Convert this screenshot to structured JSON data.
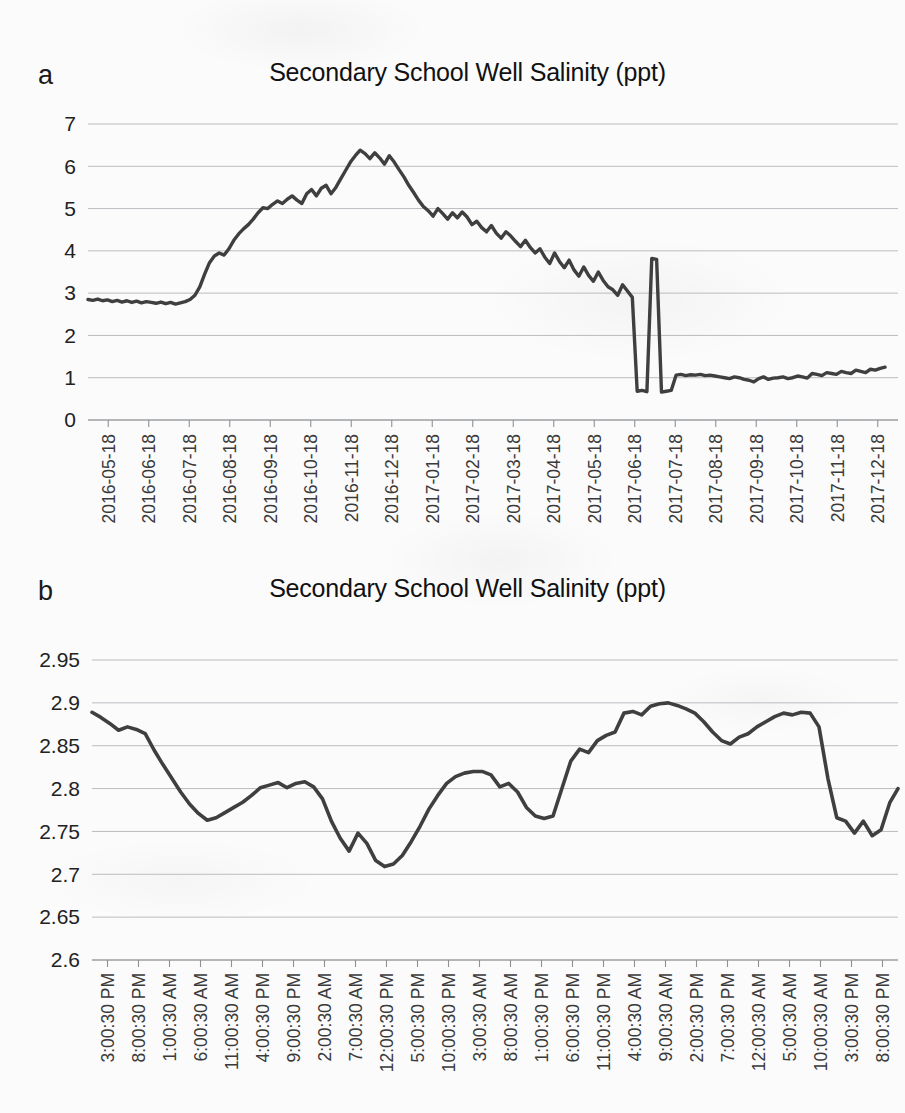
{
  "document": {
    "background_color": "#fbfbfb",
    "ink_color": "#3f3f3f",
    "gridline_color": "#b9bcc0"
  },
  "panels": [
    {
      "letter": "a",
      "title": "Secondary School Well Salinity (ppt)"
    },
    {
      "letter": "b",
      "title": "Secondary School Well Salinity (ppt)"
    }
  ],
  "chart_data": [
    {
      "type": "line",
      "panel": "a",
      "title": "Secondary School Well Salinity (ppt)",
      "xlabel": "",
      "ylabel": "",
      "ylim": [
        0,
        7
      ],
      "yticks": [
        "0",
        "1",
        "2",
        "3",
        "4",
        "5",
        "6",
        "7"
      ],
      "grid": true,
      "legend": "none",
      "x_tick_labels": [
        "2016-05-18",
        "2016-06-18",
        "2016-07-18",
        "2016-08-18",
        "2016-09-18",
        "2016-10-18",
        "2016-11-18",
        "2016-12-18",
        "2017-01-18",
        "2017-02-18",
        "2017-03-18",
        "2017-04-18",
        "2017-05-18",
        "2017-06-18",
        "2017-07-18",
        "2017-08-18",
        "2017-09-18",
        "2017-10-18",
        "2017-11-18",
        "2017-12-18"
      ],
      "x_tick_rotation": -90,
      "series": [
        {
          "name": "Salinity (ppt)",
          "x": [
            0,
            0.6,
            1.2,
            1.8,
            2.4,
            3.0,
            3.6,
            4.2,
            4.8,
            5.4,
            6.0,
            6.6,
            7.2,
            7.8,
            8.4,
            9.0,
            9.6,
            10.2,
            10.8,
            11.4,
            12.0,
            12.6,
            13.2,
            13.8,
            14.4,
            15.0,
            15.6,
            16.2,
            16.8,
            17.4,
            18.0,
            18.6,
            19.2,
            19.8,
            20.4,
            21.0,
            21.6,
            22.2,
            22.8,
            23.4,
            24.0,
            24.6,
            25.2,
            25.8,
            26.4,
            27.0,
            27.6,
            28.2,
            28.8,
            29.4,
            30.0,
            30.6,
            31.2,
            31.8,
            32.4,
            33.0,
            33.6,
            34.2,
            34.8,
            35.4,
            36.0,
            36.6,
            37.2,
            37.8,
            38.4,
            39.0,
            39.6,
            40.2,
            40.8,
            41.4,
            42.0,
            42.6,
            43.2,
            43.8,
            44.4,
            45.0,
            45.6,
            46.2,
            46.8,
            47.4,
            48.0,
            48.6,
            49.2,
            49.8,
            50.4,
            51.0,
            51.6,
            52.2,
            52.8,
            53.4,
            54.0,
            54.6,
            55.2,
            55.8,
            56.4,
            57.0,
            57.6,
            58.2,
            58.8,
            59.4,
            60.0,
            60.6,
            61.2,
            61.8,
            62.4,
            63.0,
            63.6,
            64.2,
            64.8,
            65.4,
            66.0,
            66.6,
            67.2,
            67.8,
            68.4,
            69.0,
            69.6,
            70.2,
            70.8,
            71.4,
            72.0,
            72.6,
            73.2,
            73.8,
            74.4,
            75.0,
            75.6,
            76.2,
            76.8,
            77.4,
            78.0,
            78.6,
            79.2,
            79.8,
            80.4,
            81.0,
            81.6,
            82.2,
            82.8,
            83.4,
            84.0,
            84.6,
            85.2,
            85.8,
            86.4,
            87.0,
            87.6,
            88.2,
            88.8,
            89.4,
            90.0,
            90.6,
            91.2,
            91.8,
            92.4,
            93.0,
            93.6,
            94.2,
            94.8,
            95.4,
            96.0,
            96.6,
            97.2,
            97.8,
            98.4,
            99.0,
            99.6,
            100
          ],
          "y": [
            2.85,
            2.83,
            2.86,
            2.82,
            2.84,
            2.8,
            2.83,
            2.79,
            2.82,
            2.78,
            2.81,
            2.77,
            2.8,
            2.78,
            2.76,
            2.79,
            2.75,
            2.78,
            2.74,
            2.77,
            2.8,
            2.85,
            2.95,
            3.15,
            3.45,
            3.72,
            3.88,
            3.95,
            3.9,
            4.05,
            4.25,
            4.4,
            4.52,
            4.62,
            4.75,
            4.9,
            5.02,
            5.0,
            5.1,
            5.18,
            5.12,
            5.22,
            5.3,
            5.2,
            5.12,
            5.35,
            5.45,
            5.3,
            5.48,
            5.55,
            5.35,
            5.5,
            5.7,
            5.9,
            6.1,
            6.25,
            6.38,
            6.3,
            6.18,
            6.32,
            6.2,
            6.05,
            6.25,
            6.1,
            5.92,
            5.75,
            5.55,
            5.38,
            5.2,
            5.05,
            4.95,
            4.82,
            5.0,
            4.88,
            4.75,
            4.9,
            4.78,
            4.92,
            4.8,
            4.62,
            4.7,
            4.55,
            4.45,
            4.6,
            4.42,
            4.3,
            4.45,
            4.35,
            4.22,
            4.1,
            4.25,
            4.08,
            3.95,
            4.05,
            3.85,
            3.7,
            3.95,
            3.75,
            3.6,
            3.78,
            3.55,
            3.4,
            3.62,
            3.42,
            3.28,
            3.5,
            3.3,
            3.15,
            3.08,
            2.95,
            3.2,
            3.05,
            2.9,
            0.68,
            0.7,
            0.67,
            3.82,
            3.8,
            0.66,
            0.68,
            0.7,
            1.06,
            1.08,
            1.05,
            1.07,
            1.06,
            1.08,
            1.05,
            1.06,
            1.04,
            1.02,
            1.0,
            0.98,
            1.02,
            1.0,
            0.96,
            0.94,
            0.9,
            0.98,
            1.02,
            0.96,
            0.99,
            1.0,
            1.02,
            0.98,
            1.0,
            1.04,
            1.02,
            0.99,
            1.1,
            1.08,
            1.05,
            1.12,
            1.1,
            1.08,
            1.15,
            1.12,
            1.1,
            1.18,
            1.15,
            1.12,
            1.2,
            1.18,
            1.22,
            1.25
          ]
        }
      ],
      "data_summary": {
        "start_value": 2.85,
        "baseline_before_rise": 2.8,
        "max_value": 6.4,
        "max_at": "2016-08-18",
        "crash_min": 0.65,
        "crash_at": "2016-11-18",
        "plateau_after_crash": 1.05,
        "second_peak": 3.5,
        "second_peak_at": "2017-08-18",
        "post_peak_step": 2.05,
        "end_value": 1.0
      }
    },
    {
      "type": "line",
      "panel": "b",
      "title": "Secondary School Well Salinity (ppt)",
      "xlabel": "",
      "ylabel": "",
      "ylim": [
        2.6,
        2.95
      ],
      "yticks": [
        "2.6",
        "2.65",
        "2.7",
        "2.75",
        "2.8",
        "2.85",
        "2.9",
        "2.95"
      ],
      "grid": true,
      "legend": "none",
      "x_tick_labels": [
        "3:00:30 PM",
        "8:00:30 PM",
        "1:00:30 AM",
        "6:00:30 AM",
        "11:00:30 AM",
        "4:00:30 PM",
        "9:00:30 PM",
        "2:00:30 AM",
        "7:00:30 AM",
        "12:00:30 PM",
        "5:00:30 PM",
        "10:00:30 PM",
        "3:00:30 AM",
        "8:00:30 AM",
        "1:00:30 PM",
        "6:00:30 PM",
        "11:00:30 PM",
        "4:00:30 AM",
        "9:00:30 AM",
        "2:00:30 PM",
        "7:00:30 PM",
        "12:00:30 AM",
        "5:00:30 AM",
        "10:00:30 AM",
        "3:00:30 PM",
        "8:00:30 PM"
      ],
      "x_tick_rotation": -90,
      "series": [
        {
          "name": "Salinity (ppt)",
          "x": [
            0,
            1.1,
            2.2,
            3.3,
            4.4,
            5.5,
            6.6,
            7.7,
            8.8,
            9.9,
            11.0,
            12.1,
            13.2,
            14.3,
            15.4,
            16.5,
            17.6,
            18.7,
            19.8,
            20.9,
            22.0,
            23.1,
            24.2,
            25.3,
            26.4,
            27.5,
            28.6,
            29.7,
            30.8,
            31.9,
            33.0,
            34.1,
            35.2,
            36.3,
            37.4,
            38.5,
            39.6,
            40.7,
            41.8,
            42.9,
            44.0,
            45.1,
            46.2,
            47.3,
            48.4,
            49.5,
            50.6,
            51.7,
            52.8,
            53.9,
            55.0,
            56.1,
            57.2,
            58.3,
            59.4,
            60.5,
            61.6,
            62.7,
            63.8,
            64.9,
            66.0,
            67.1,
            68.2,
            69.3,
            70.4,
            71.5,
            72.6,
            73.7,
            74.8,
            75.9,
            77.0,
            78.1,
            79.2,
            80.3,
            81.4,
            82.5,
            83.6,
            84.7,
            85.8,
            86.9,
            88.0,
            89.1,
            90.2,
            91.3,
            92.4,
            93.5,
            94.6,
            95.7,
            96.8,
            97.9,
            99.0,
            100
          ],
          "y": [
            2.889,
            2.883,
            2.876,
            2.868,
            2.872,
            2.869,
            2.864,
            2.845,
            2.828,
            2.812,
            2.796,
            2.782,
            2.771,
            2.763,
            2.766,
            2.772,
            2.778,
            2.784,
            2.792,
            2.801,
            2.804,
            2.807,
            2.801,
            2.806,
            2.808,
            2.802,
            2.788,
            2.762,
            2.742,
            2.727,
            2.748,
            2.736,
            2.716,
            2.709,
            2.712,
            2.722,
            2.738,
            2.756,
            2.776,
            2.792,
            2.806,
            2.814,
            2.818,
            2.82,
            2.82,
            2.816,
            2.802,
            2.806,
            2.796,
            2.778,
            2.768,
            2.765,
            2.768,
            2.8,
            2.832,
            2.846,
            2.842,
            2.856,
            2.862,
            2.866,
            2.888,
            2.89,
            2.886,
            2.896,
            2.899,
            2.9,
            2.897,
            2.893,
            2.888,
            2.878,
            2.866,
            2.856,
            2.852,
            2.86,
            2.864,
            2.872,
            2.878,
            2.884,
            2.888,
            2.886,
            2.889,
            2.888,
            2.872,
            2.812,
            2.766,
            2.762,
            2.748,
            2.762,
            2.745,
            2.752,
            2.784,
            2.8,
            2.808,
            2.812,
            2.818,
            2.824
          ]
        }
      ],
      "data_summary": {
        "start_value": 2.889,
        "first_min": 2.763,
        "global_min": 2.708,
        "global_max": 2.9,
        "end_value": 2.824
      }
    }
  ]
}
